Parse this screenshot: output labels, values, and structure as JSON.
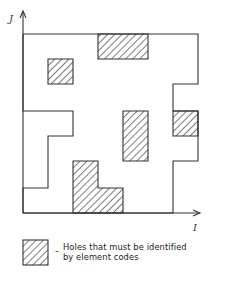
{
  "diagram": {
    "axes": {
      "x_label": "I",
      "y_label": "J"
    },
    "region": {
      "description": "Irregular outer boundary of element grid",
      "outline_points": [
        [
          23,
          34
        ],
        [
          98,
          34
        ],
        [
          148,
          34
        ],
        [
          198,
          34
        ],
        [
          198,
          84
        ],
        [
          173,
          84
        ],
        [
          173,
          111
        ],
        [
          198,
          111
        ],
        [
          198,
          161
        ],
        [
          173,
          161
        ],
        [
          173,
          213
        ],
        [
          123,
          213
        ],
        [
          73,
          213
        ],
        [
          23,
          213
        ],
        [
          23,
          188
        ],
        [
          48,
          188
        ],
        [
          48,
          136
        ],
        [
          73,
          136
        ],
        [
          73,
          111
        ],
        [
          23,
          111
        ],
        [
          23,
          34
        ]
      ]
    },
    "holes": [
      {
        "id": "hole-top",
        "points": [
          [
            98,
            34
          ],
          [
            148,
            34
          ],
          [
            148,
            59
          ],
          [
            98,
            59
          ]
        ]
      },
      {
        "id": "hole-upper-left",
        "points": [
          [
            48,
            59
          ],
          [
            73,
            59
          ],
          [
            73,
            84
          ],
          [
            48,
            84
          ]
        ]
      },
      {
        "id": "hole-center",
        "points": [
          [
            123,
            111
          ],
          [
            148,
            111
          ],
          [
            148,
            161
          ],
          [
            123,
            161
          ]
        ]
      },
      {
        "id": "hole-right",
        "points": [
          [
            173,
            111
          ],
          [
            198,
            111
          ],
          [
            198,
            136
          ],
          [
            173,
            136
          ]
        ]
      },
      {
        "id": "hole-bottom-l",
        "points": [
          [
            73,
            161
          ],
          [
            98,
            161
          ],
          [
            98,
            188
          ],
          [
            123,
            188
          ],
          [
            123,
            213
          ],
          [
            73,
            213
          ]
        ]
      }
    ],
    "legend": {
      "dash": "–",
      "line1": "Holes that must be identified",
      "line2": "by element codes"
    },
    "colors": {
      "stroke": "#333333",
      "hatch": "#333333",
      "background": "#ffffff"
    }
  }
}
